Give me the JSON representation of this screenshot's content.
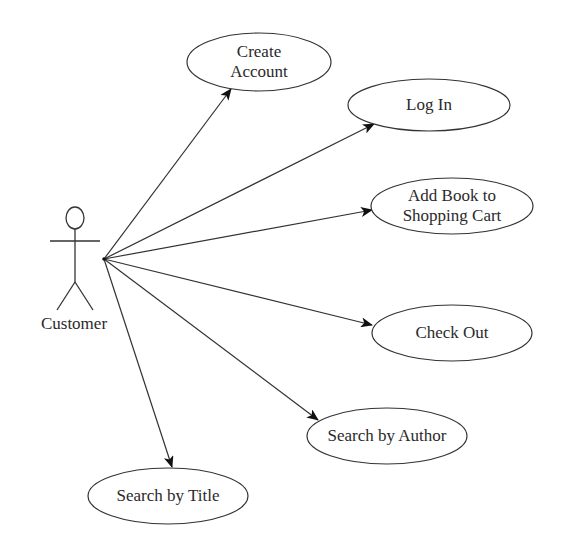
{
  "diagram": {
    "type": "uml-use-case",
    "actor": {
      "name": "Customer",
      "head": {
        "cx": 75,
        "cy": 218,
        "rx": 9,
        "ry": 11
      },
      "hub": {
        "x": 104,
        "y": 259
      },
      "label_pos": {
        "x": 74,
        "y": 324
      }
    },
    "use_cases": [
      {
        "id": "create-account",
        "lines": [
          "Create",
          "Account"
        ],
        "cx": 259,
        "cy": 62,
        "rx": 72,
        "ry": 29,
        "arrow_tip": {
          "x": 231,
          "y": 89
        }
      },
      {
        "id": "log-in",
        "lines": [
          "Log In"
        ],
        "cx": 429,
        "cy": 105,
        "rx": 81,
        "ry": 26,
        "arrow_tip": {
          "x": 374,
          "y": 124
        }
      },
      {
        "id": "add-book-to-shopping-cart",
        "lines": [
          "Add Book to",
          "Shopping Cart"
        ],
        "cx": 452,
        "cy": 206,
        "rx": 81,
        "ry": 28,
        "arrow_tip": {
          "x": 372,
          "y": 210
        }
      },
      {
        "id": "check-out",
        "lines": [
          "Check Out"
        ],
        "cx": 452,
        "cy": 333,
        "rx": 80,
        "ry": 28,
        "arrow_tip": {
          "x": 372,
          "y": 325
        }
      },
      {
        "id": "search-by-author",
        "lines": [
          "Search by Author"
        ],
        "cx": 387,
        "cy": 436,
        "rx": 80,
        "ry": 28,
        "arrow_tip": {
          "x": 318,
          "y": 420
        }
      },
      {
        "id": "search-by-title",
        "lines": [
          "Search by Title"
        ],
        "cx": 168,
        "cy": 496,
        "rx": 80,
        "ry": 28,
        "arrow_tip": {
          "x": 172,
          "y": 467
        }
      }
    ],
    "colors": {
      "stroke": "#333333",
      "text": "#2a2a2a",
      "background": "#ffffff"
    }
  }
}
